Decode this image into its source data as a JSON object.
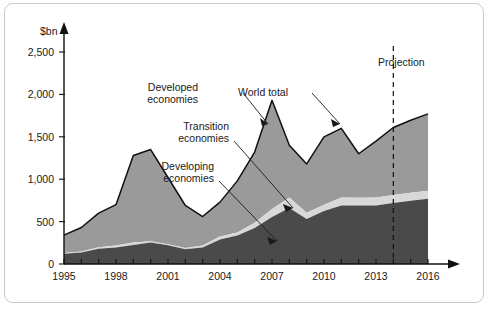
{
  "chart_data": {
    "type": "area",
    "stacked": true,
    "title": "",
    "subtitle": "",
    "xlabel": "",
    "ylabel": "$bn",
    "ylim": [
      0,
      2500
    ],
    "xlim": [
      1995,
      2016
    ],
    "ytick_labels": [
      "0",
      "500",
      "1,000",
      "1,500",
      "2,000",
      "2,500"
    ],
    "ytick_values": [
      0,
      500,
      1000,
      1500,
      2000,
      2500
    ],
    "xtick_labels": [
      "1995",
      "1998",
      "2001",
      "2004",
      "2007",
      "2010",
      "2013",
      "2016"
    ],
    "xtick_values": [
      1995,
      1998,
      2001,
      2004,
      2007,
      2010,
      2013,
      2016
    ],
    "x": [
      1995,
      1996,
      1997,
      1998,
      1999,
      2000,
      2001,
      2002,
      2003,
      2004,
      2005,
      2006,
      2007,
      2008,
      2009,
      2010,
      2011,
      2012,
      2013,
      2014,
      2015,
      2016
    ],
    "grid": false,
    "legend_position": "inline-annotations",
    "series": [
      {
        "name": "Developing economies",
        "color": "#4a4a4a",
        "values": [
          120,
          135,
          180,
          195,
          225,
          255,
          220,
          175,
          195,
          290,
          335,
          425,
          555,
          660,
          530,
          625,
          690,
          690,
          690,
          720,
          745,
          770
        ]
      },
      {
        "name": "Transition economies",
        "color": "#d8d8d8",
        "values": [
          10,
          12,
          18,
          22,
          30,
          12,
          12,
          15,
          22,
          35,
          35,
          60,
          95,
          125,
          75,
          75,
          95,
          90,
          95,
          95,
          95,
          95
        ]
      },
      {
        "name": "Developed economies",
        "color": "#9a9a9a",
        "values": [
          210,
          283,
          402,
          483,
          1025,
          1083,
          788,
          500,
          343,
          405,
          610,
          835,
          1280,
          615,
          575,
          800,
          815,
          520,
          665,
          795,
          855,
          905
        ]
      }
    ],
    "world_total": {
      "name": "World total",
      "values": [
        340,
        430,
        600,
        700,
        1280,
        1350,
        1020,
        690,
        560,
        730,
        980,
        1320,
        1930,
        1400,
        1180,
        1500,
        1600,
        1300,
        1450,
        1610,
        1695,
        1770
      ]
    },
    "annotations": [
      {
        "id": "developed",
        "label_line1": "Developed",
        "label_line2": "economies"
      },
      {
        "id": "world-total",
        "label_line1": "World total",
        "label_line2": ""
      },
      {
        "id": "transition",
        "label_line1": "Transition",
        "label_line2": "economies"
      },
      {
        "id": "developing",
        "label_line1": "Developing",
        "label_line2": "economies"
      },
      {
        "id": "projection",
        "label_line1": "Projection",
        "label_line2": ""
      }
    ],
    "projection_start": 2014
  }
}
